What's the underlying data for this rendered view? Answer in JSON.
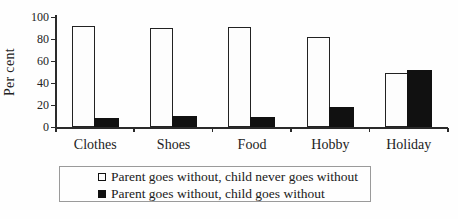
{
  "chart_data": {
    "type": "bar",
    "title": "",
    "xlabel": "",
    "ylabel": "Per cent",
    "categories": [
      "Clothes",
      "Shoes",
      "Food",
      "Hobby",
      "Holiday"
    ],
    "series": [
      {
        "name": "Parent goes without, child never goes without",
        "key": "child-never-goes-without",
        "fill": "#fdfdfd",
        "values": [
          92,
          90,
          91,
          82,
          49
        ]
      },
      {
        "name": "Parent goes without, child goes without",
        "key": "child-goes-without",
        "fill": "#111111",
        "values": [
          8,
          10,
          9,
          18,
          52
        ]
      }
    ],
    "ylim": [
      0,
      100
    ],
    "yticks": [
      0,
      20,
      40,
      60,
      80,
      100
    ],
    "yticklabels": [
      "0",
      "20",
      "40",
      "60",
      "80",
      "100"
    ],
    "grid": false,
    "legend_position": "bottom-box"
  },
  "colors": {
    "axis": "#2a2a2a",
    "text": "#1a1a1a",
    "bar_outline": "#222222",
    "bar_fill_black": "#111111",
    "bar_fill_white": "#fdfdfd",
    "legend_border": "#9a9a9a",
    "background": "#fefefe"
  }
}
